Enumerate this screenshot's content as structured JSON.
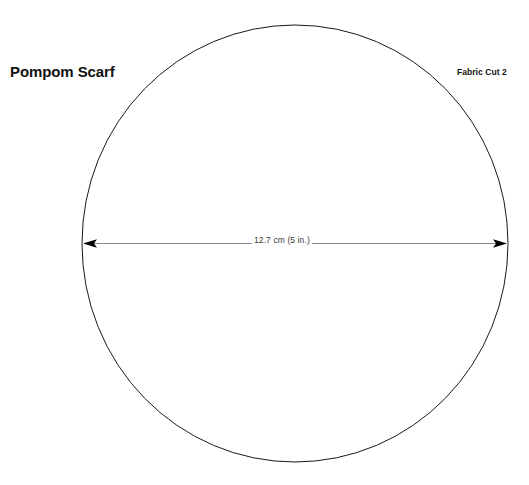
{
  "sheet": {
    "background_color": "#ffffff",
    "width": 529,
    "height": 485
  },
  "pattern": {
    "title": "Pompom Scarf",
    "fabric_cut_note": "Fabric Cut 2",
    "shape": "circle",
    "stroke_color": "#1a1a1a",
    "dimension": {
      "label": "12.7 cm (5 in.)",
      "value_cm": 12.7,
      "value_in": 5,
      "measure": "diameter",
      "line_color": "#8a8a8a",
      "arrow_color": "#000000",
      "text_color": "#3a3a3a"
    }
  }
}
